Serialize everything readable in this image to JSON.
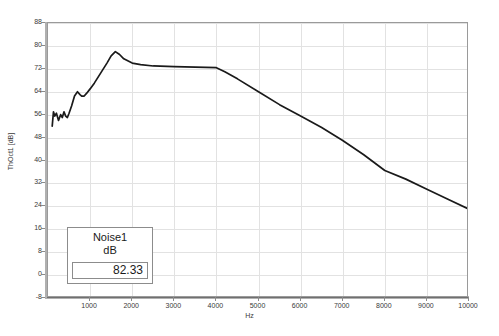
{
  "chart_data": {
    "type": "line",
    "title": "",
    "xlabel": "Hz",
    "ylabel": "ThOct1 [dB]",
    "xlim": [
      0,
      10000
    ],
    "ylim": [
      -8,
      88
    ],
    "grid": true,
    "xticks": [
      1000,
      2000,
      3000,
      4000,
      5000,
      6000,
      7000,
      8000,
      9000,
      10000
    ],
    "yticks": [
      -8,
      0,
      8,
      16,
      24,
      32,
      40,
      48,
      56,
      64,
      72,
      80,
      88
    ],
    "legend_position": "inside-lower-left",
    "series": [
      {
        "name": "Noise1",
        "unit": "dB",
        "overall_value": "82.33",
        "color": "#1a1a1a",
        "x": [
          100,
          130,
          160,
          200,
          250,
          300,
          340,
          380,
          420,
          460,
          500,
          560,
          630,
          700,
          760,
          800,
          860,
          920,
          1000,
          1100,
          1250,
          1400,
          1500,
          1600,
          1700,
          1800,
          2000,
          2200,
          2500,
          3000,
          3500,
          4000,
          4200,
          4500,
          5000,
          5500,
          6000,
          6500,
          7000,
          7500,
          8000,
          8500,
          9000,
          9500,
          10000
        ],
        "y": [
          52.0,
          57.0,
          55.5,
          56.5,
          54.0,
          56.0,
          55.0,
          57.0,
          55.5,
          55.0,
          56.5,
          59.0,
          62.5,
          64.0,
          63.0,
          62.5,
          62.5,
          63.5,
          65.0,
          67.0,
          70.5,
          74.0,
          76.5,
          78.0,
          77.0,
          75.5,
          74.0,
          73.5,
          73.0,
          72.8,
          72.6,
          72.4,
          71.0,
          68.5,
          64.0,
          59.5,
          55.5,
          51.5,
          47.0,
          42.0,
          36.5,
          33.5,
          30.0,
          26.5,
          23.0
        ]
      }
    ]
  },
  "axes": {
    "y_label": "ThOct1 [dB]",
    "x_label": "Hz",
    "y_tick_labels": [
      "88",
      "80",
      "72",
      "64",
      "56",
      "48",
      "40",
      "32",
      "24",
      "16",
      "8",
      "0",
      "-8"
    ],
    "x_tick_labels": [
      "1000",
      "2000",
      "3000",
      "4000",
      "5000",
      "6000",
      "7000",
      "8000",
      "9000",
      "10000"
    ]
  },
  "legend": {
    "name": "Noise1",
    "unit": "dB",
    "value": "82.33"
  },
  "colors": {
    "curve": "#1a1a1a",
    "grid": "#e2e2e2",
    "axis": "#6f6f6f",
    "text": "#3a3a3a",
    "background": "#ffffff"
  }
}
